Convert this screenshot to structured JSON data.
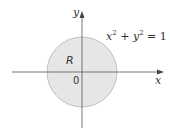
{
  "figure": {
    "x_axis_label": "x",
    "y_axis_label": "y",
    "region_label": "R",
    "origin_label": "0",
    "equation": {
      "var1": "x",
      "exp1": "2",
      "plus": " + ",
      "var2": "y",
      "exp2": "2",
      "equals": " = 1"
    },
    "colors": {
      "region_fill": "#e6e6e6",
      "circle_stroke": "#b5b5b5",
      "axis": "#555555"
    }
  }
}
